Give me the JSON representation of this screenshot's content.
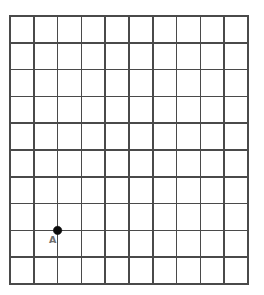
{
  "figure": {
    "background_color": "#ffffff",
    "grid_line_color": "#4a4a4a",
    "point_color": "#0b0b0b",
    "label_color": "#6e6e6e"
  },
  "grid": {
    "columns": 10,
    "rows": 10,
    "left": 10,
    "top": 16,
    "right": 248,
    "bottom": 284,
    "cell_width": 23.8,
    "cell_height": 26.8,
    "line_width": 1.6,
    "border_width": 1.8
  },
  "points": [
    {
      "id": "A",
      "label": "A",
      "grid_col": 2,
      "grid_row": 8,
      "x": 57.6,
      "y": 230.4,
      "radius": 4.2,
      "label_x": 49,
      "label_y": 243,
      "color": "#0b0b0b"
    }
  ],
  "chart_data": {
    "type": "scatter",
    "xlabel": "",
    "ylabel": "",
    "xlim": [
      0,
      10
    ],
    "ylim": [
      0,
      10
    ],
    "grid": true,
    "grid_columns": 10,
    "grid_rows": 10,
    "legend": "none",
    "tick_labels_x": [],
    "tick_labels_y": [],
    "series": [
      {
        "name": "A",
        "x": [
          2
        ],
        "y": [
          2
        ],
        "labels": [
          "A"
        ],
        "marker": "filled-circle",
        "color": "#0b0b0b"
      }
    ],
    "annotations": [
      {
        "text": "A",
        "x": 2,
        "y": 2,
        "position": "below-left"
      }
    ]
  }
}
